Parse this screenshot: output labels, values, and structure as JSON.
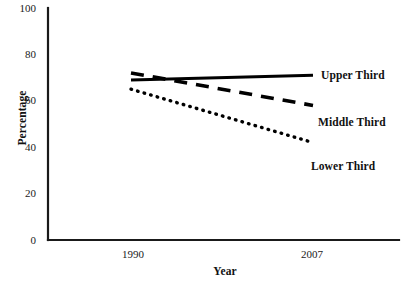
{
  "chart_data": {
    "type": "line",
    "title": "",
    "xlabel": "Year",
    "ylabel": "Percentage",
    "x": [
      1990,
      2007
    ],
    "xtick_labels": [
      "1990",
      "2007"
    ],
    "ytick_labels": [
      "0",
      "20",
      "40",
      "60",
      "80",
      "100"
    ],
    "yticks": [
      0,
      20,
      40,
      60,
      80,
      100
    ],
    "ylim": [
      0,
      100
    ],
    "grid": false,
    "legend_position": "right-inline-labels",
    "series": [
      {
        "name": "Upper Third",
        "style": "solid",
        "color": "#000000",
        "values": [
          69,
          71
        ]
      },
      {
        "name": "Middle Third",
        "style": "dashed",
        "color": "#000000",
        "values": [
          72,
          58
        ]
      },
      {
        "name": "Lower Third",
        "style": "dotted",
        "color": "#000000",
        "values": [
          65,
          42
        ]
      }
    ]
  },
  "axis": {
    "y_title": "Percentage",
    "x_title": "Year",
    "y_ticks": [
      {
        "label": "100"
      },
      {
        "label": "80"
      },
      {
        "label": "60"
      },
      {
        "label": "40"
      },
      {
        "label": "20"
      },
      {
        "label": "0"
      }
    ],
    "x_ticks": [
      {
        "label": "1990"
      },
      {
        "label": "2007"
      }
    ]
  },
  "labels": {
    "upper": "Upper Third",
    "middle": "Middle Third",
    "lower": "Lower Third"
  },
  "colors": {
    "ink": "#000000",
    "background": "#ffffff"
  }
}
